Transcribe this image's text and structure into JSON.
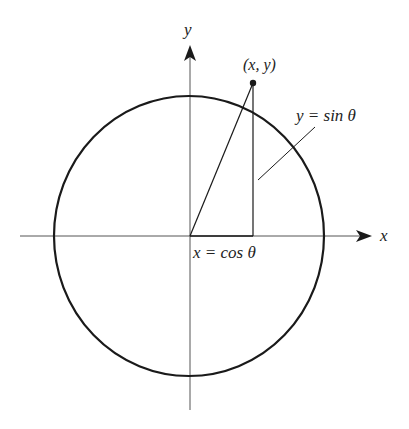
{
  "diagram": {
    "colors": {
      "stroke": "#1a1a1a",
      "axis": "#555555",
      "background": "#ffffff"
    },
    "labels": {
      "y_axis": "y",
      "x_axis": "x",
      "point": "(x, y)",
      "sin": "y = sin θ",
      "cos": "x = cos θ"
    },
    "icons": {
      "x_axis_arrow": "arrow-right-icon",
      "y_axis_arrow": "arrow-up-icon",
      "point_marker": "dot-icon"
    }
  }
}
